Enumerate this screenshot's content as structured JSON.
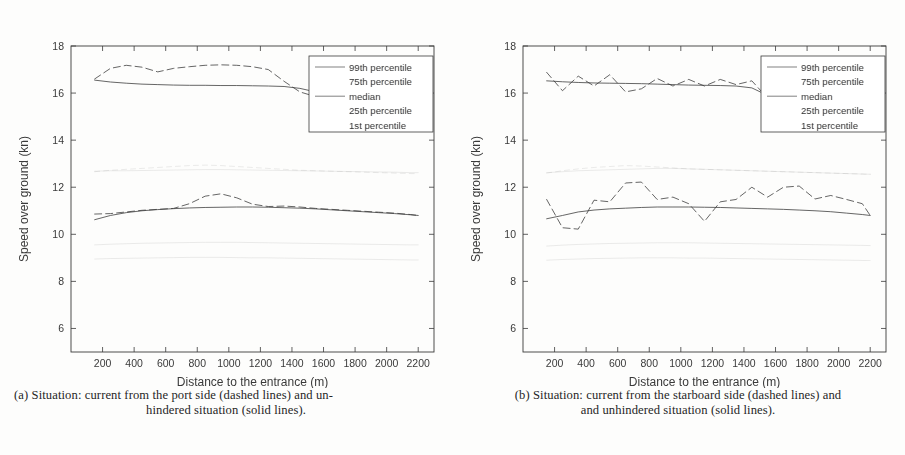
{
  "document": {
    "background_color": "#fdfdfc",
    "ink_color": "#3a3a3a"
  },
  "figure": {
    "panels": [
      {
        "id": "a",
        "caption_line_1": "(a) Situation: current from the port side (dashed lines) and un-",
        "caption_line_2": "hindered situation (solid lines)."
      },
      {
        "id": "b",
        "caption_line_1": "(b) Situation: current from the starboard side (dashed lines) and",
        "caption_line_2": "and unhindered situation (solid lines)."
      }
    ]
  },
  "chart_data": [
    {
      "panel": "a",
      "type": "line",
      "title": "",
      "xlabel": "Distance to the entrance (m)",
      "ylabel": "Speed over ground (kn)",
      "xlim": [
        0,
        2300
      ],
      "ylim": [
        5,
        18
      ],
      "xticks": [
        200,
        400,
        600,
        800,
        1000,
        1200,
        1400,
        1600,
        1800,
        2000,
        2200
      ],
      "yticks": [
        6,
        8,
        10,
        12,
        14,
        16,
        18
      ],
      "grid": false,
      "legend_position": "top-right",
      "legend_entries": [
        "99th percentile",
        "75th percentile",
        "median",
        "25th percentile",
        "1st percentile"
      ],
      "x": [
        150,
        250,
        350,
        450,
        550,
        650,
        750,
        850,
        950,
        1050,
        1150,
        1250,
        1350,
        1450,
        1550,
        1650,
        1750,
        1850,
        1950,
        2050,
        2150,
        2200
      ],
      "series": [
        {
          "name": "99th percentile (unhindered, solid)",
          "style": "solid",
          "values": [
            16.55,
            16.47,
            16.42,
            16.38,
            16.36,
            16.34,
            16.33,
            16.33,
            16.32,
            16.32,
            16.31,
            16.3,
            16.28,
            16.2,
            16.05,
            15.9,
            15.85,
            15.82,
            15.8,
            15.79,
            15.78,
            15.78
          ]
        },
        {
          "name": "99th percentile (current from port, dashed)",
          "style": "dashed",
          "values": [
            16.6,
            17.05,
            17.18,
            17.1,
            16.9,
            17.05,
            17.12,
            17.18,
            17.2,
            17.18,
            17.12,
            17.0,
            16.5,
            16.05,
            15.85,
            15.82,
            15.8,
            15.78,
            15.78,
            15.78,
            15.78,
            15.78
          ]
        },
        {
          "name": "75th percentile (unhindered, solid)",
          "style": "solid-faint",
          "values": [
            12.68,
            12.7,
            12.7,
            12.71,
            12.72,
            12.73,
            12.74,
            12.75,
            12.75,
            12.74,
            12.73,
            12.72,
            12.71,
            12.7,
            12.69,
            12.68,
            12.67,
            12.66,
            12.65,
            12.64,
            12.62,
            12.62
          ]
        },
        {
          "name": "75th percentile (current from port, dashed)",
          "style": "dashed-faint",
          "values": [
            12.66,
            12.72,
            12.76,
            12.8,
            12.84,
            12.88,
            12.92,
            12.94,
            12.92,
            12.88,
            12.84,
            12.8,
            12.76,
            12.72,
            12.7,
            12.68,
            12.66,
            12.64,
            12.62,
            12.6,
            12.58,
            12.58
          ]
        },
        {
          "name": "median (unhindered, solid)",
          "style": "solid",
          "values": [
            10.62,
            10.8,
            10.92,
            11.0,
            11.05,
            11.09,
            11.12,
            11.14,
            11.15,
            11.16,
            11.16,
            11.15,
            11.13,
            11.11,
            11.08,
            11.04,
            11.0,
            10.96,
            10.92,
            10.88,
            10.83,
            10.8
          ]
        },
        {
          "name": "median (current from port, dashed)",
          "style": "dashed",
          "values": [
            10.86,
            10.88,
            10.95,
            11.02,
            11.06,
            11.1,
            11.3,
            11.62,
            11.72,
            11.55,
            11.28,
            11.18,
            11.2,
            11.16,
            11.1,
            11.06,
            11.02,
            10.98,
            10.94,
            10.9,
            10.84,
            10.8
          ]
        },
        {
          "name": "25th percentile (unhindered, solid)",
          "style": "solid-faint",
          "values": [
            9.55,
            9.58,
            9.6,
            9.62,
            9.63,
            9.64,
            9.65,
            9.66,
            9.66,
            9.66,
            9.65,
            9.64,
            9.63,
            9.62,
            9.61,
            9.6,
            9.59,
            9.58,
            9.57,
            9.56,
            9.55,
            9.55
          ]
        },
        {
          "name": "1st percentile (unhindered, solid)",
          "style": "solid-faint",
          "values": [
            8.95,
            8.97,
            8.98,
            8.99,
            9.0,
            9.01,
            9.02,
            9.02,
            9.02,
            9.01,
            9.0,
            9.0,
            8.99,
            8.98,
            8.97,
            8.96,
            8.95,
            8.94,
            8.93,
            8.92,
            8.91,
            8.91
          ]
        }
      ]
    },
    {
      "panel": "b",
      "type": "line",
      "title": "",
      "xlabel": "Distance to the entrance (m)",
      "ylabel": "Speed over ground (kn)",
      "xlim": [
        0,
        2300
      ],
      "ylim": [
        5,
        18
      ],
      "xticks": [
        200,
        400,
        600,
        800,
        1000,
        1200,
        1400,
        1600,
        1800,
        2000,
        2200
      ],
      "yticks": [
        6,
        8,
        10,
        12,
        14,
        16,
        18
      ],
      "grid": false,
      "legend_position": "top-right",
      "legend_entries": [
        "99th percentile",
        "75th percentile",
        "median",
        "25th percentile",
        "1st percentile"
      ],
      "x": [
        150,
        250,
        350,
        450,
        550,
        650,
        750,
        850,
        950,
        1050,
        1150,
        1250,
        1350,
        1450,
        1550,
        1650,
        1750,
        1850,
        1950,
        2050,
        2150,
        2200
      ],
      "series": [
        {
          "name": "99th percentile (unhindered, solid)",
          "style": "solid",
          "values": [
            16.52,
            16.48,
            16.45,
            16.43,
            16.42,
            16.41,
            16.4,
            16.38,
            16.36,
            16.34,
            16.33,
            16.32,
            16.3,
            16.22,
            15.9,
            15.82,
            15.8,
            15.79,
            15.78,
            15.78,
            15.78,
            15.78
          ]
        },
        {
          "name": "99th percentile (current from starboard, dashed)",
          "style": "dashed",
          "values": [
            16.88,
            16.1,
            16.72,
            16.3,
            16.78,
            16.05,
            16.18,
            16.62,
            16.3,
            16.58,
            16.3,
            16.58,
            16.36,
            16.52,
            15.78,
            15.8,
            15.79,
            15.78,
            15.78,
            15.78,
            15.78,
            15.78
          ]
        },
        {
          "name": "75th percentile (unhindered, solid)",
          "style": "solid-faint",
          "values": [
            12.62,
            12.66,
            12.7,
            12.72,
            12.74,
            12.76,
            12.78,
            12.8,
            12.8,
            12.78,
            12.76,
            12.74,
            12.72,
            12.7,
            12.68,
            12.66,
            12.64,
            12.62,
            12.6,
            12.58,
            12.56,
            12.55
          ]
        },
        {
          "name": "75th percentile (current from starboard, dashed)",
          "style": "dashed-faint",
          "values": [
            12.6,
            12.7,
            12.78,
            12.84,
            12.88,
            12.92,
            12.9,
            12.86,
            12.82,
            12.78,
            12.76,
            12.74,
            12.72,
            12.7,
            12.68,
            12.66,
            12.64,
            12.62,
            12.6,
            12.58,
            12.56,
            12.55
          ]
        },
        {
          "name": "median (unhindered, solid)",
          "style": "solid",
          "values": [
            10.66,
            10.8,
            10.95,
            11.03,
            11.08,
            11.11,
            11.14,
            11.16,
            11.16,
            11.16,
            11.15,
            11.14,
            11.12,
            11.1,
            11.08,
            11.06,
            11.03,
            11.0,
            10.96,
            10.9,
            10.84,
            10.8
          ]
        },
        {
          "name": "median (current from starboard, dashed)",
          "style": "dashed",
          "values": [
            11.48,
            10.28,
            10.22,
            11.45,
            11.38,
            12.18,
            12.22,
            11.48,
            11.58,
            11.3,
            10.55,
            11.38,
            11.48,
            12.0,
            11.58,
            12.0,
            12.05,
            11.5,
            11.65,
            11.48,
            11.3,
            10.8
          ]
        },
        {
          "name": "25th percentile (unhindered, solid)",
          "style": "solid-faint",
          "values": [
            9.5,
            9.54,
            9.57,
            9.59,
            9.61,
            9.62,
            9.63,
            9.64,
            9.64,
            9.64,
            9.63,
            9.62,
            9.61,
            9.6,
            9.59,
            9.58,
            9.57,
            9.56,
            9.55,
            9.54,
            9.53,
            9.52
          ]
        },
        {
          "name": "1st percentile (unhindered, solid)",
          "style": "solid-faint",
          "values": [
            8.9,
            8.93,
            8.95,
            8.97,
            8.98,
            8.99,
            9.0,
            9.0,
            9.0,
            8.99,
            8.99,
            8.98,
            8.97,
            8.96,
            8.95,
            8.94,
            8.93,
            8.92,
            8.91,
            8.9,
            8.89,
            8.88
          ]
        }
      ]
    }
  ]
}
